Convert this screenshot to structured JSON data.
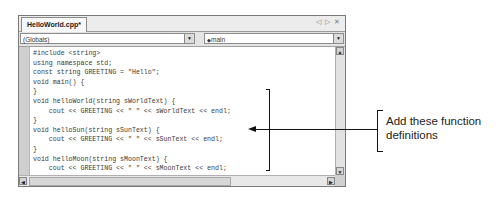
{
  "window": {
    "tab_label": "HelloWorld.cpp*",
    "tab_controls": "◁ ▷ ✕"
  },
  "combos": {
    "scope_value": "(Globals)",
    "member_icon": "◆",
    "member_value": "main",
    "dropdown_glyph": "▼"
  },
  "scrollbars": {
    "up_glyph": "▲",
    "down_glyph": "▼",
    "left_glyph": "◀",
    "right_glyph": "▶"
  },
  "code": {
    "lines": [
      "#include <string>",
      "using namespace std;",
      "const string GREETING = \"Hello\";",
      "void main() {",
      "}",
      "void helloWorld(string sWorldText) {",
      "    cout << GREETING << \" \" << sWorldText << endl;",
      "}",
      "void helloSun(string sSunText) {",
      "    cout << GREETING << \" \" << sSunText << endl;",
      "}",
      "void helloMoon(string sMoonText) {",
      "    cout << GREETING << \" \" << sMoonText << endl;",
      "}"
    ]
  },
  "callout": {
    "text": "Add these function definitions"
  }
}
